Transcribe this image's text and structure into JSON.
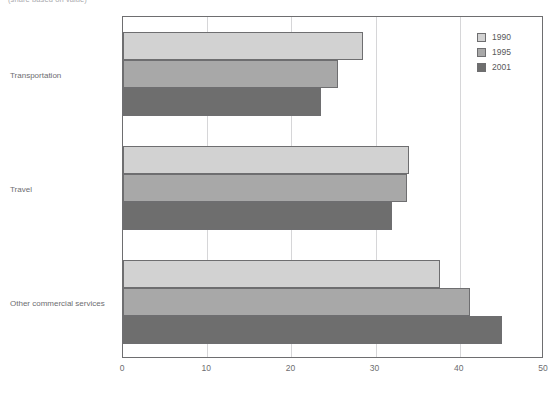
{
  "caption": "(share based on value)",
  "chart_data": {
    "type": "bar",
    "orientation": "horizontal",
    "title": "",
    "subtitle": "(share based on value)",
    "xlabel": "",
    "ylabel": "",
    "categories": [
      "Transportation",
      "Travel",
      "Other commercial services"
    ],
    "series": [
      {
        "name": "1990",
        "color": "#d2d2d2",
        "values": [
          28.5,
          34.0,
          37.7
        ]
      },
      {
        "name": "1995",
        "color": "#a8a8a8",
        "values": [
          25.5,
          33.7,
          41.2
        ]
      },
      {
        "name": "2001",
        "color": "#6e6e6e",
        "values": [
          23.5,
          32.0,
          45.0
        ]
      }
    ],
    "xlim": [
      0,
      50
    ],
    "xticks": [
      0,
      10,
      20,
      30,
      40,
      50
    ],
    "xtick_labels": [
      "0",
      "10",
      "20",
      "30",
      "40",
      "50"
    ],
    "grid": true,
    "grid_axis": "x",
    "legend_position": "top-right",
    "legend_entries": [
      "1990",
      "1995",
      "2001"
    ]
  },
  "colors": {
    "series_1990": "#d2d2d2",
    "series_1995": "#a8a8a8",
    "series_2001": "#6e6e6e",
    "axis": "#6e6e70",
    "gridline": "#d6d6d8",
    "text": "#6d6d70"
  }
}
